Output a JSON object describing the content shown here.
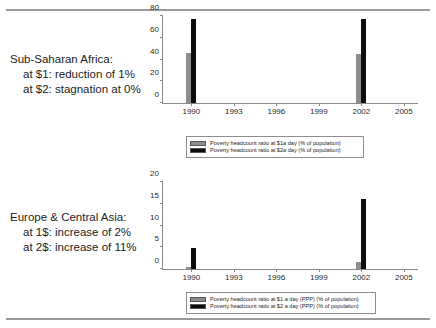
{
  "colors": {
    "series1": "#8d8d8d",
    "series2": "#0d0d0d",
    "axis": "#8b8b8b",
    "rule": "#9a9a9a",
    "text": "#1d1d1d"
  },
  "clipped_top_text": "",
  "panels": [
    {
      "id": "sub-saharan-africa",
      "caption": {
        "line1": "Sub-Saharan Africa:",
        "line2": "at $1: reduction of 1%",
        "line3": "at $2:  stagnation at 0%"
      },
      "chart_data": {
        "type": "bar",
        "title": "",
        "xlabel": "",
        "ylabel": "",
        "categories": [
          1990,
          2002
        ],
        "x": [
          1990,
          2002
        ],
        "xlim": [
          1988,
          2006
        ],
        "xticks": [
          "1990",
          "1993",
          "1996",
          "1999",
          "2002",
          "2005"
        ],
        "xtick_values": [
          1990,
          1993,
          1996,
          1999,
          2002,
          2005
        ],
        "ylim": [
          0,
          80
        ],
        "yticks": [
          "0",
          "20",
          "40",
          "60",
          "80"
        ],
        "ytick_values": [
          0,
          20,
          40,
          60,
          80
        ],
        "grid": false,
        "legend_position": "bottom",
        "series": [
          {
            "name": "Poverty headcount ratio at $1a day (% of population)",
            "color": "#8d8d8d",
            "values": [
              46.0,
              45.0
            ]
          },
          {
            "name": "Poverty headcount ratio at $2a day (% of population)",
            "color": "#0d0d0d",
            "values": [
              77.5,
              77.5
            ]
          }
        ]
      }
    },
    {
      "id": "europe-central-asia",
      "caption": {
        "line1": "Europe & Central Asia:",
        "line2": "at 1$:  increase of 2%",
        "line3": "at 2$:  increase of 11%"
      },
      "chart_data": {
        "type": "bar",
        "title": "",
        "xlabel": "",
        "ylabel": "",
        "categories": [
          1990,
          2002
        ],
        "x": [
          1990,
          2002
        ],
        "xlim": [
          1988,
          2006
        ],
        "xticks": [
          "1990",
          "1993",
          "1996",
          "1999",
          "2002",
          "2005"
        ],
        "xtick_values": [
          1990,
          1993,
          1996,
          1999,
          2002,
          2005
        ],
        "ylim": [
          0,
          20
        ],
        "yticks": [
          "0",
          "5",
          "10",
          "15",
          "20"
        ],
        "ytick_values": [
          0,
          5,
          10,
          15,
          20
        ],
        "grid": false,
        "legend_position": "bottom",
        "series": [
          {
            "name": "Poverty headcount ratio at $1 a day (PPP) (% of population)",
            "color": "#8d8d8d",
            "values": [
              0.5,
              1.6
            ]
          },
          {
            "name": "Poverty headcount ratio at $2 a day (PPP) (% of population)",
            "color": "#0d0d0d",
            "values": [
              4.8,
              16.1
            ]
          }
        ]
      }
    }
  ]
}
